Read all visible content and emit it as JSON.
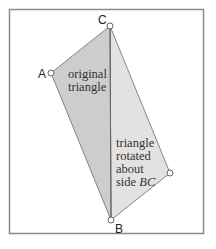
{
  "diagram": {
    "colors": {
      "frame": "#8a8a8a",
      "original_fill": "#cfcfcf",
      "rotated_fill": "#e0e0e0",
      "edge": "#6a6a6a"
    },
    "points": {
      "A": "A",
      "B": "B",
      "C": "C"
    },
    "labels": {
      "original": [
        "original",
        "triangle"
      ],
      "rotated": [
        "triangle",
        "rotated",
        "about"
      ],
      "rotated_side_prefix": "side ",
      "rotated_side_name": "BC"
    }
  }
}
